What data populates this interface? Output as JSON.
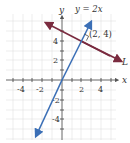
{
  "diagram": {
    "type": "coordinate-plane",
    "axes": {
      "x_label": "x",
      "y_label": "y",
      "x_ticks": [
        "-4",
        "-2",
        "2",
        "4"
      ],
      "y_ticks": [
        "4",
        "2",
        "-2",
        "-4"
      ]
    },
    "lines": [
      {
        "name": "y = 2x",
        "label": "y = 2x",
        "color": "#3b6fb6"
      },
      {
        "name": "L",
        "label": "L",
        "color": "#7a2b3f"
      }
    ],
    "point": {
      "label": "(2, 4)",
      "x": 2,
      "y": 4
    },
    "right_angle_marker": true,
    "colors": {
      "grid": "#dcdcdc",
      "axis": "#555555",
      "line_blue": "#3b6fb6",
      "line_maroon": "#7a2b3f"
    }
  }
}
